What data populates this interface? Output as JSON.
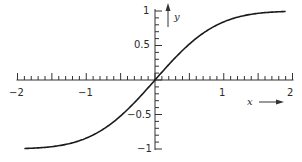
{
  "chart_data": {
    "type": "line",
    "title": "",
    "xlabel": "x",
    "ylabel": "y",
    "xlim": [
      -2,
      2
    ],
    "ylim": [
      -1,
      1
    ],
    "grid": false,
    "legend": null,
    "x_ticks_major": [
      -2,
      -1,
      0,
      1,
      2
    ],
    "x_tick_labels": [
      "−2",
      "−1",
      "1",
      "2"
    ],
    "x_minor_step": 0.1,
    "y_tick_labels": [
      "1",
      "0.5",
      "−0.5",
      "−1"
    ],
    "y_ticks_major": [
      1,
      0.5,
      -0.5,
      -1
    ],
    "y_minor_step": 0.1,
    "series": [
      {
        "name": "y = erf(x)",
        "x": [
          -1.9,
          -1.75,
          -1.5,
          -1.25,
          -1.0,
          -0.75,
          -0.5,
          -0.25,
          0,
          0.25,
          0.5,
          0.75,
          1.0,
          1.25,
          1.5,
          1.75,
          1.9
        ],
        "values": [
          -0.99,
          -0.99,
          -0.97,
          -0.92,
          -0.84,
          -0.71,
          -0.52,
          -0.28,
          0,
          0.28,
          0.52,
          0.71,
          0.84,
          0.92,
          0.97,
          0.99,
          0.99
        ]
      }
    ],
    "annotations": [
      "x ⟶ arrow label on horizontal axis",
      "y ↑ arrow label on vertical axis"
    ]
  },
  "labels": {
    "x_axis_name": "x",
    "y_axis_name": "y",
    "xm2": "−2",
    "xm1": "−1",
    "x1": "1",
    "x2": "2",
    "y1": "1",
    "y05": "0.5",
    "ym05": "−0.5",
    "ym1": "−1"
  },
  "colors": {
    "curve": "#1a1a1a",
    "axis": "#333333"
  }
}
